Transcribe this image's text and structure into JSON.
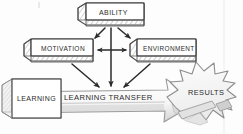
{
  "diagram": {
    "style": "hand-drawn sketch, pencil grayscale",
    "background_color": "#fdfdfd",
    "ink_color": "#2b2b2b",
    "shade_color": "#b9b9b9",
    "nodes": {
      "ability": {
        "label": "ABILITY",
        "shape": "3d-box"
      },
      "motivation": {
        "label": "MOTIVATION",
        "shape": "3d-box"
      },
      "environment": {
        "label": "ENVIRONMENT",
        "shape": "3d-box"
      },
      "learning": {
        "label": "LEARNING",
        "shape": "3d-cube"
      },
      "learning_transfer": {
        "label": "LEARNING TRANSFER",
        "shape": "block-arrow"
      },
      "results": {
        "label": "RESULTS",
        "shape": "starburst"
      }
    },
    "connections": [
      {
        "from": "ability",
        "to": "motivation",
        "type": "arrow"
      },
      {
        "from": "ability",
        "to": "environment",
        "type": "arrow"
      },
      {
        "from": "motivation",
        "to": "environment",
        "type": "double-arrow"
      },
      {
        "from": "ability",
        "to": "learning_transfer",
        "type": "arrow"
      },
      {
        "from": "motivation",
        "to": "learning_transfer",
        "type": "arrow"
      },
      {
        "from": "environment",
        "to": "learning_transfer",
        "type": "arrow"
      },
      {
        "from": "learning",
        "to": "results",
        "type": "block-arrow"
      }
    ]
  }
}
